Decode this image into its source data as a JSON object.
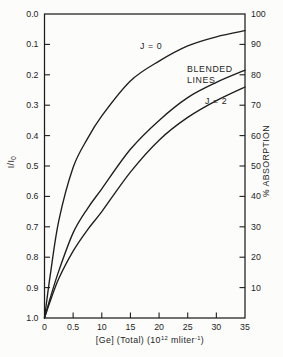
{
  "figure": {
    "background": "#fcfcfa",
    "ink": "#1e1e1e"
  },
  "chart_data": {
    "type": "line",
    "title": "",
    "xlabel": "[Ge] (Total) (10^12 mliter^-1)",
    "xlabel_parts": [
      "[Ge] (Total) (10",
      "12",
      " mliter",
      "-1",
      ")"
    ],
    "ylabel_left": "I/I0",
    "ylabel_left_parts": [
      "I/I",
      "0"
    ],
    "ylabel_right": "% ABSORPTION",
    "x_range": [
      0,
      35
    ],
    "y_left_range_top_to_bottom": [
      0.0,
      1.0
    ],
    "y_right_range_top_to_bottom": [
      100,
      0
    ],
    "grid": false,
    "frame": "box",
    "x_tick_values": [
      0,
      5,
      10,
      15,
      20,
      25,
      30,
      35
    ],
    "x_tick_labels": [
      "0",
      "0.5",
      "10",
      "15",
      "20",
      "25",
      "30",
      "35"
    ],
    "y_left_tick_values": [
      0.0,
      0.1,
      0.2,
      0.3,
      0.4,
      0.5,
      0.6,
      0.7,
      0.8,
      0.9,
      1.0
    ],
    "y_left_tick_labels": [
      "0.0",
      "0.1",
      "0.2",
      "0.3",
      "0.4",
      "0.5",
      "0.6",
      "0.7",
      "0.8",
      "0.9",
      "1.0"
    ],
    "y_right_tick_values": [
      100,
      90,
      80,
      70,
      60,
      50,
      40,
      30,
      20,
      10
    ],
    "y_right_tick_labels": [
      "100",
      "90",
      "80",
      "70",
      "60",
      "50",
      "40",
      "30",
      "20",
      "10"
    ],
    "x": [
      0,
      1,
      2.5,
      5,
      7.5,
      10,
      15,
      20,
      25,
      30,
      35
    ],
    "series": [
      {
        "name": "J = 0",
        "values": [
          1.0,
          0.86,
          0.68,
          0.505,
          0.41,
          0.335,
          0.22,
          0.155,
          0.105,
          0.075,
          0.055
        ]
      },
      {
        "name": "BLENDED LINES",
        "values": [
          1.0,
          0.935,
          0.845,
          0.72,
          0.64,
          0.575,
          0.445,
          0.35,
          0.275,
          0.225,
          0.185
        ]
      },
      {
        "name": "J = 2",
        "values": [
          1.0,
          0.945,
          0.87,
          0.78,
          0.71,
          0.65,
          0.52,
          0.415,
          0.34,
          0.285,
          0.24
        ]
      }
    ],
    "annotations": [
      {
        "text": "J = 0",
        "x": 140,
        "y": 49
      },
      {
        "text": "BLENDED",
        "x": 187,
        "y": 72
      },
      {
        "text": "LINES",
        "x": 187,
        "y": 83
      },
      {
        "text": "J = 2",
        "x": 205,
        "y": 104
      }
    ]
  }
}
